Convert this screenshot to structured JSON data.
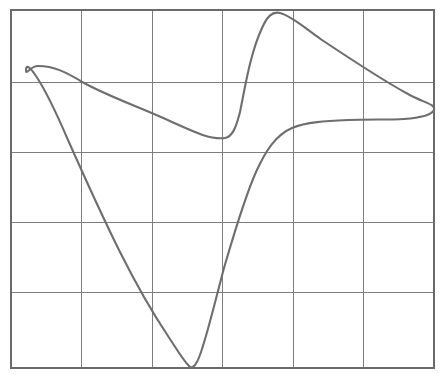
{
  "figure": {
    "title": "",
    "caption": "",
    "width": 444,
    "height": 378,
    "background_color": "#ffffff"
  },
  "chart_data": {
    "type": "line",
    "title": "",
    "subtitle": "",
    "xlabel": "",
    "ylabel": "",
    "grid": true,
    "grid_columns": 6,
    "grid_rows": 5,
    "legend": [],
    "annotations": [],
    "axis_ticks_visible": false,
    "tick_labels_x": [],
    "tick_labels_y": [],
    "xlim": [
      0,
      6
    ],
    "ylim": [
      0,
      5
    ],
    "plot_area": {
      "left": 11,
      "top": 10,
      "right": 434,
      "bottom": 368,
      "x_gridlines": [
        11,
        81,
        152,
        222,
        293,
        363,
        434
      ],
      "y_gridlines": [
        10,
        82,
        152,
        222,
        292,
        368
      ]
    },
    "series": [
      {
        "name": "closed-curve",
        "closed": true,
        "stroke_color": "#6e6e6e",
        "stroke_width": 2.1,
        "key_points": [
          {
            "label": "left-loop-apex",
            "x": 38,
            "y": 66
          },
          {
            "label": "left-loop-leftmost",
            "x": 24,
            "y": 78
          },
          {
            "label": "descending-crossing-col1",
            "x": 81,
            "y": 82
          },
          {
            "label": "mid-descent",
            "x": 152,
            "y": 112
          },
          {
            "label": "local-minimum-left-basin",
            "x": 227,
            "y": 137
          },
          {
            "label": "steep-rise",
            "x": 250,
            "y": 60
          },
          {
            "label": "top-peak",
            "x": 272,
            "y": 14
          },
          {
            "label": "upper-right-descent",
            "x": 363,
            "y": 70
          },
          {
            "label": "right-tip",
            "x": 434,
            "y": 106
          },
          {
            "label": "right-plateau",
            "x": 363,
            "y": 118
          },
          {
            "label": "plateau-turn",
            "x": 293,
            "y": 126
          },
          {
            "label": "steep-drop",
            "x": 240,
            "y": 210
          },
          {
            "label": "bottom-valley",
            "x": 196,
            "y": 368
          },
          {
            "label": "valley-left-rise",
            "x": 150,
            "y": 325
          },
          {
            "label": "long-left-ascent",
            "x": 81,
            "y": 185
          },
          {
            "label": "back-to-apex",
            "x": 30,
            "y": 74
          }
        ],
        "path": "M 38 66 C 54 66 66 72 84 83 C 112 98 142 108 172 122 C 192 131 210 140 225 138 C 232 137 236 128 240 112 C 245 88 250 54 262 28 C 267 17 272 11 280 13 C 292 16 306 29 322 40 C 346 56 382 80 408 94 C 424 103 436 104 434 110 C 431 116 418 118 404 119 C 388 120 368 119 348 120 C 326 121 306 122 292 128 C 276 135 266 150 256 172 C 244 199 234 234 224 268 C 216 298 208 332 201 352 C 197 364 193 370 189 366 C 183 360 176 348 168 336 C 152 312 136 284 120 252 C 102 216 84 176 68 140 C 56 112 44 88 36 76 C 30 67 26 64 26 70 C 26 76 30 66 38 66 Z"
      }
    ],
    "grid_style": {
      "line_color": "#7d7d7d",
      "border_color": "#6a6a6a",
      "line_width": 1
    }
  }
}
